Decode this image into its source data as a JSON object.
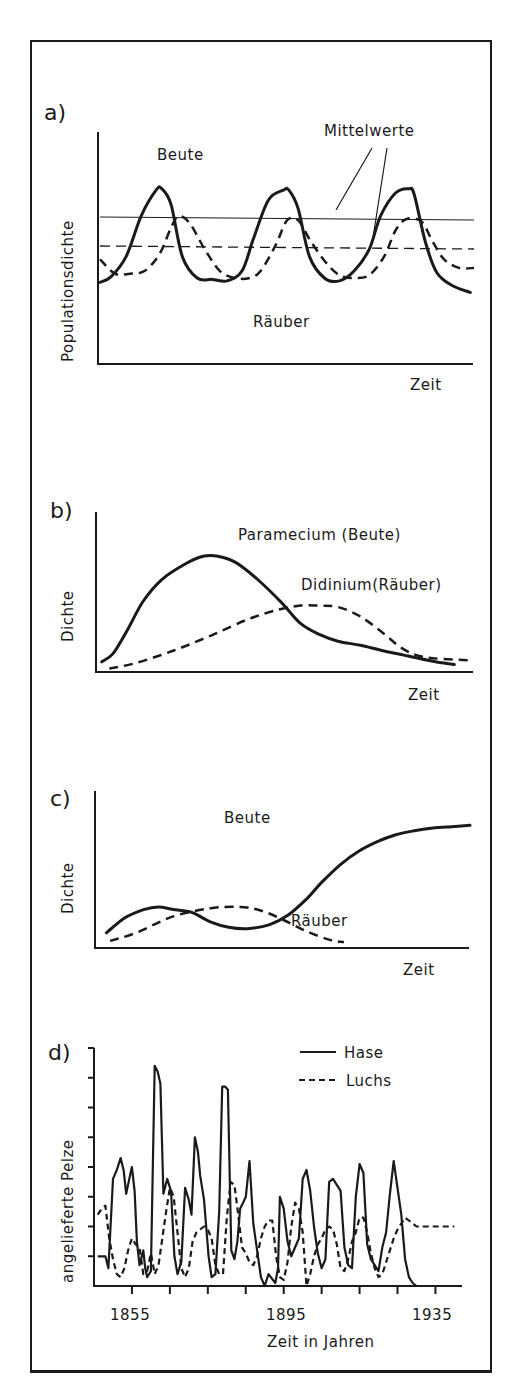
{
  "chart_data": [
    {
      "id": "a",
      "type": "line",
      "panel_label": "a)",
      "title": "",
      "xlabel": "Zeit",
      "ylabel": "Populationsdichte",
      "xlim": [
        0,
        10
      ],
      "ylim": [
        0,
        10
      ],
      "grid": false,
      "annotations": [
        "Beute",
        "Räuber",
        "Mittelwerte"
      ],
      "series": [
        {
          "name": "Beute",
          "style": "solid",
          "x": [
            0,
            0.3,
            0.7,
            1.1,
            1.5,
            1.65,
            1.9,
            2.2,
            2.6,
            3.0,
            3.4,
            3.8,
            4.1,
            4.5,
            4.9,
            5.05,
            5.3,
            5.6,
            6.0,
            6.4,
            6.8,
            7.2,
            7.5,
            7.9,
            8.25,
            8.4,
            8.7,
            9.0,
            9.4,
            9.9
          ],
          "y": [
            2.2,
            2.6,
            4.0,
            6.8,
            8.6,
            8.7,
            7.6,
            4.0,
            2.5,
            2.4,
            2.3,
            3.0,
            5.2,
            7.9,
            8.6,
            8.6,
            7.3,
            4.0,
            2.5,
            2.3,
            3.0,
            4.5,
            6.8,
            8.4,
            8.7,
            8.3,
            5.0,
            2.9,
            2.0,
            1.5
          ]
        },
        {
          "name": "Räuber",
          "style": "dashed",
          "x": [
            0,
            0.4,
            0.8,
            1.2,
            1.6,
            1.9,
            2.1,
            2.4,
            2.8,
            3.2,
            3.6,
            4.0,
            4.3,
            4.7,
            5.0,
            5.3,
            5.6,
            6.0,
            6.4,
            6.8,
            7.2,
            7.6,
            7.9,
            8.2,
            8.6,
            8.9,
            9.2,
            9.6,
            10.0
          ],
          "y": [
            3.8,
            2.8,
            2.8,
            3.0,
            4.2,
            6.0,
            6.8,
            6.3,
            4.5,
            3.0,
            2.5,
            2.5,
            3.0,
            4.8,
            6.5,
            6.5,
            5.2,
            3.7,
            2.7,
            2.5,
            2.7,
            4.0,
            5.8,
            6.6,
            6.4,
            5.0,
            3.8,
            3.2,
            3.2
          ]
        }
      ],
      "hlines": [
        {
          "name": "Mittelwert Beute",
          "style": "solid",
          "y": 5.9
        },
        {
          "name": "Mittelwert Räuber",
          "style": "dashed",
          "y": 4.6
        }
      ]
    },
    {
      "id": "b",
      "type": "line",
      "panel_label": "b)",
      "title": "",
      "xlabel": "Zeit",
      "ylabel": "Dichte",
      "xlim": [
        0,
        10
      ],
      "ylim": [
        0,
        10
      ],
      "grid": false,
      "series": [
        {
          "name": "Paramecium (Beute)",
          "style": "solid",
          "x": [
            0.1,
            0.4,
            0.8,
            1.2,
            1.7,
            2.3,
            2.8,
            3.2,
            3.7,
            4.3,
            4.9,
            5.4,
            5.9,
            6.4,
            7.0,
            7.6,
            8.3,
            9.0,
            9.5
          ],
          "y": [
            0.6,
            1.2,
            3.0,
            5.0,
            6.6,
            7.7,
            8.3,
            8.3,
            7.8,
            6.5,
            4.9,
            3.4,
            2.6,
            2.1,
            1.8,
            1.4,
            1.0,
            0.6,
            0.4
          ]
        },
        {
          "name": "Didinium (Räuber)",
          "style": "dashed",
          "x": [
            0.3,
            1.0,
            2.0,
            3.0,
            4.0,
            4.8,
            5.4,
            5.9,
            6.4,
            7.0,
            7.6,
            8.1,
            8.6,
            9.2,
            10.0
          ],
          "y": [
            0.1,
            0.5,
            1.4,
            2.5,
            3.7,
            4.4,
            4.7,
            4.7,
            4.6,
            3.9,
            2.7,
            1.6,
            1.0,
            0.8,
            0.7
          ]
        }
      ]
    },
    {
      "id": "c",
      "type": "line",
      "panel_label": "c)",
      "title": "",
      "xlabel": "Zeit",
      "ylabel": "Dichte",
      "xlim": [
        0,
        10
      ],
      "ylim": [
        0,
        10
      ],
      "grid": false,
      "series": [
        {
          "name": "Beute",
          "style": "solid",
          "x": [
            0.2,
            0.7,
            1.2,
            1.6,
            2.0,
            2.5,
            3.0,
            3.5,
            4.0,
            4.6,
            5.1,
            5.6,
            6.0,
            6.5,
            7.0,
            7.5,
            8.0,
            8.5,
            9.0,
            9.5,
            10.0
          ],
          "y": [
            0.9,
            2.0,
            2.6,
            2.8,
            2.6,
            2.4,
            1.7,
            1.3,
            1.2,
            1.5,
            2.2,
            3.4,
            4.6,
            5.9,
            6.9,
            7.6,
            8.1,
            8.4,
            8.6,
            8.7,
            8.8
          ]
        },
        {
          "name": "Räuber",
          "style": "dashed",
          "x": [
            0.3,
            1.0,
            2.0,
            3.0,
            3.8,
            4.4,
            5.0,
            5.6,
            6.2,
            6.6
          ],
          "y": [
            0.3,
            0.9,
            2.1,
            2.7,
            2.8,
            2.5,
            1.8,
            1.0,
            0.4,
            0.2
          ]
        }
      ],
      "annotations": [
        "Beute",
        "Räuber"
      ]
    },
    {
      "id": "d",
      "type": "line",
      "panel_label": "d)",
      "title": "",
      "xlabel": "Zeit in Jahren",
      "ylabel": "angelieferte Pelze",
      "xlim": [
        1845,
        1942
      ],
      "ylim": [
        0,
        8
      ],
      "x_ticks": [
        1855,
        1865,
        1875,
        1885,
        1895,
        1905,
        1915,
        1925,
        1935
      ],
      "x_tick_labels": [
        "1855",
        "1895",
        "1935"
      ],
      "y_ticks": [
        1,
        2,
        3,
        4,
        5,
        6,
        7,
        8
      ],
      "grid": false,
      "legend": {
        "position": "top-right",
        "entries": [
          {
            "name": "Hase",
            "style": "solid"
          },
          {
            "name": "Luchs",
            "style": "dashed"
          }
        ]
      },
      "series": [
        {
          "name": "Hase",
          "style": "solid",
          "x": [
            1846,
            1848,
            1848.8,
            1850,
            1851,
            1852,
            1852.8,
            1853.5,
            1854.3,
            1855,
            1855.7,
            1856.3,
            1857,
            1858,
            1858.5,
            1859,
            1860,
            1861,
            1861.8,
            1862.5,
            1863.3,
            1864.3,
            1865.3,
            1866.2,
            1867,
            1868,
            1869,
            1870,
            1870.7,
            1871.6,
            1872.4,
            1873,
            1874,
            1875.2,
            1876,
            1877,
            1878,
            1878.8,
            1879.6,
            1880.3,
            1881.2,
            1882,
            1882.8,
            1883.5,
            1884.3,
            1885,
            1886,
            1887,
            1888,
            1889,
            1890,
            1891,
            1892.8,
            1893.5,
            1894,
            1895,
            1896,
            1897,
            1898,
            1899,
            1900,
            1901,
            1902,
            1903,
            1904,
            1905,
            1906,
            1907,
            1908,
            1909,
            1910,
            1911,
            1912,
            1913,
            1914,
            1915,
            1916,
            1917,
            1918,
            1919,
            1920,
            1921,
            1922,
            1923,
            1924,
            1925,
            1926,
            1927,
            1928,
            1929,
            1930,
            1931,
            1932,
            1933,
            1934,
            1935
          ],
          "y": [
            1.0,
            1.0,
            0.6,
            3.6,
            3.9,
            4.3,
            3.9,
            3.1,
            3.6,
            4.0,
            3.2,
            1.5,
            0.7,
            1.2,
            0.6,
            0.3,
            0.5,
            7.4,
            7.2,
            6.8,
            3.1,
            3.6,
            3.2,
            1.0,
            0.4,
            0.8,
            3.3,
            2.9,
            2.4,
            5.0,
            4.5,
            3.7,
            2.9,
            1.0,
            0.3,
            0.4,
            2.5,
            6.7,
            6.7,
            6.6,
            1.2,
            0.9,
            1.5,
            2.6,
            2.8,
            3.0,
            4.2,
            2.1,
            1.2,
            0.3,
            0.0,
            0.4,
            0.1,
            0.6,
            3.0,
            2.6,
            1.5,
            1.0,
            1.3,
            1.6,
            3.6,
            3.9,
            3.2,
            2.0,
            1.1,
            0.6,
            0.9,
            3.5,
            3.6,
            3.4,
            3.2,
            1.3,
            0.7,
            0.6,
            3.0,
            4.1,
            3.8,
            1.4,
            0.9,
            0.7,
            0.5,
            1.3,
            1.8,
            3.1,
            4.2,
            3.3,
            2.4,
            0.9,
            0.3,
            0.1,
            0.0,
            0.0,
            0.0,
            0.0,
            0.0,
            0.0
          ]
        },
        {
          "name": "Luchs",
          "style": "dashed",
          "x": [
            1846,
            1847,
            1848,
            1849,
            1850,
            1851,
            1852,
            1853,
            1854,
            1855,
            1856,
            1857,
            1858,
            1859,
            1860,
            1861,
            1862,
            1863,
            1864,
            1865,
            1866,
            1867,
            1868,
            1869,
            1870,
            1871,
            1872,
            1873,
            1874,
            1875,
            1876,
            1877,
            1878,
            1879,
            1880,
            1881,
            1882,
            1883,
            1884,
            1885,
            1886,
            1887,
            1888,
            1889,
            1890,
            1891,
            1892,
            1893,
            1894,
            1895,
            1896,
            1897,
            1898,
            1899,
            1900,
            1901,
            1902,
            1903,
            1904,
            1905,
            1906,
            1907,
            1908,
            1909,
            1910,
            1911,
            1912,
            1913,
            1914,
            1915,
            1916,
            1917,
            1918,
            1919,
            1920,
            1921,
            1922,
            1923,
            1924,
            1925,
            1926,
            1927,
            1928,
            1929,
            1930,
            1931,
            1932,
            1933,
            1934,
            1935,
            1936,
            1937,
            1938,
            1939,
            1940
          ],
          "y": [
            2.4,
            2.6,
            2.7,
            1.6,
            0.9,
            0.4,
            0.3,
            0.6,
            1.2,
            1.6,
            1.4,
            1.3,
            0.4,
            0.5,
            1.1,
            0.4,
            0.7,
            1.6,
            2.5,
            3.3,
            3.0,
            1.8,
            0.6,
            0.3,
            0.6,
            1.5,
            1.8,
            1.9,
            2.0,
            1.9,
            1.6,
            0.7,
            0.4,
            0.4,
            2.3,
            3.5,
            3.4,
            2.4,
            1.3,
            1.1,
            0.8,
            0.7,
            1.0,
            1.6,
            2.0,
            2.2,
            2.2,
            1.0,
            0.3,
            0.2,
            0.8,
            2.0,
            2.8,
            2.6,
            1.8,
            0.0,
            0.4,
            1.0,
            1.4,
            1.6,
            1.9,
            2.0,
            1.9,
            1.4,
            0.6,
            0.5,
            0.9,
            1.5,
            1.8,
            2.3,
            2.3,
            1.8,
            1.1,
            0.6,
            0.3,
            0.4,
            0.8,
            1.2,
            1.6,
            1.9,
            2.1,
            2.3,
            2.2,
            2.1,
            2.0,
            2.0,
            2.0,
            2.0,
            2.0,
            2.0,
            2.0,
            2.0,
            2.0,
            2.0,
            2.0
          ]
        }
      ]
    }
  ],
  "panels": {
    "a": {
      "label": "a)",
      "ylabel": "Populationsdichte",
      "xlabel": "Zeit",
      "beute": "Beute",
      "raeuber": "Räuber",
      "mittel": "Mittelwerte"
    },
    "b": {
      "label": "b)",
      "ylabel": "Dichte",
      "xlabel": "Zeit",
      "beute": "Paramecium (Beute)",
      "raeuber": "Didinium(Räuber)"
    },
    "c": {
      "label": "c)",
      "ylabel": "Dichte",
      "xlabel": "Zeit",
      "beute": "Beute",
      "raeuber": "Räuber"
    },
    "d": {
      "label": "d)",
      "ylabel": "angelieferte Pelze",
      "xlabel": "Zeit in Jahren",
      "legend_hase": "Hase",
      "legend_luchs": "Luchs",
      "tick1855": "1855",
      "tick1895": "1895",
      "tick1935": "1935"
    }
  }
}
